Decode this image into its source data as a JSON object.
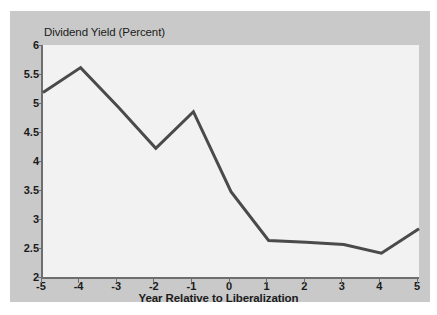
{
  "chart_data": {
    "type": "line",
    "title": "Dividend Yield (Percent)",
    "xlabel": "Year Relative to Liberalization",
    "ylabel": "",
    "x": [
      -5,
      -4,
      -3,
      -2,
      -1,
      0,
      1,
      2,
      3,
      4,
      5
    ],
    "values": [
      5.18,
      5.61,
      4.93,
      4.22,
      4.85,
      3.47,
      2.63,
      2.6,
      2.56,
      2.41,
      2.83
    ],
    "xticklabels": [
      "-5",
      "-4",
      "-3",
      "-2",
      "-1",
      "0",
      "1",
      "2",
      "3",
      "4",
      "5"
    ],
    "yticklabels": [
      "2",
      "2.5",
      "3",
      "3.5",
      "4",
      "4.5",
      "5",
      "5.5",
      "6"
    ],
    "yticks": [
      2,
      2.5,
      3,
      3.5,
      4,
      4.5,
      5,
      5.5,
      6
    ],
    "xlim": [
      -5,
      5
    ],
    "ylim": [
      2,
      6
    ],
    "grid": false,
    "legend": null,
    "line_color": "#4a4a4a",
    "plot_background": "#f2f2f2",
    "figure_background": "#c9c9c9",
    "page_background": "#ffffff",
    "axis_color": "#6e6e6e"
  }
}
